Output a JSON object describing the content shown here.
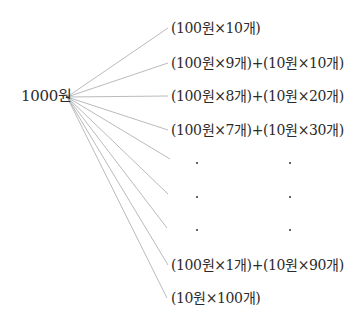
{
  "diagram": {
    "type": "tree-fan",
    "root": {
      "label": "1000원",
      "x": 67,
      "y": 97
    },
    "branches": [
      {
        "label": "(100원×10개)",
        "y": 28,
        "end_x": 168
      },
      {
        "label": "(100원×9개)+(10원×10개)",
        "y": 63,
        "end_x": 168
      },
      {
        "label": "(100원×8개)+(10원×20개)",
        "y": 96,
        "end_x": 168
      },
      {
        "label": "(100원×7개)+(10원×30개)",
        "y": 130,
        "end_x": 168
      },
      {
        "label": "·",
        "y": 160,
        "end_x": 170,
        "ellipsis": true
      },
      {
        "label": "·",
        "y": 194,
        "end_x": 168,
        "ellipsis": true
      },
      {
        "label": "·",
        "y": 228,
        "end_x": 167,
        "ellipsis": true
      },
      {
        "label": "(100원×1개)+(10원×90개)",
        "y": 265,
        "end_x": 168
      },
      {
        "label": "(10원×100개)",
        "y": 298,
        "end_x": 167
      }
    ],
    "ellipsis_dots": {
      "columns_x": [
        197,
        290
      ],
      "rows_y": [
        163,
        197,
        230
      ]
    },
    "line_color": "#a8a8a8",
    "text_color": "#2b2b2b"
  }
}
